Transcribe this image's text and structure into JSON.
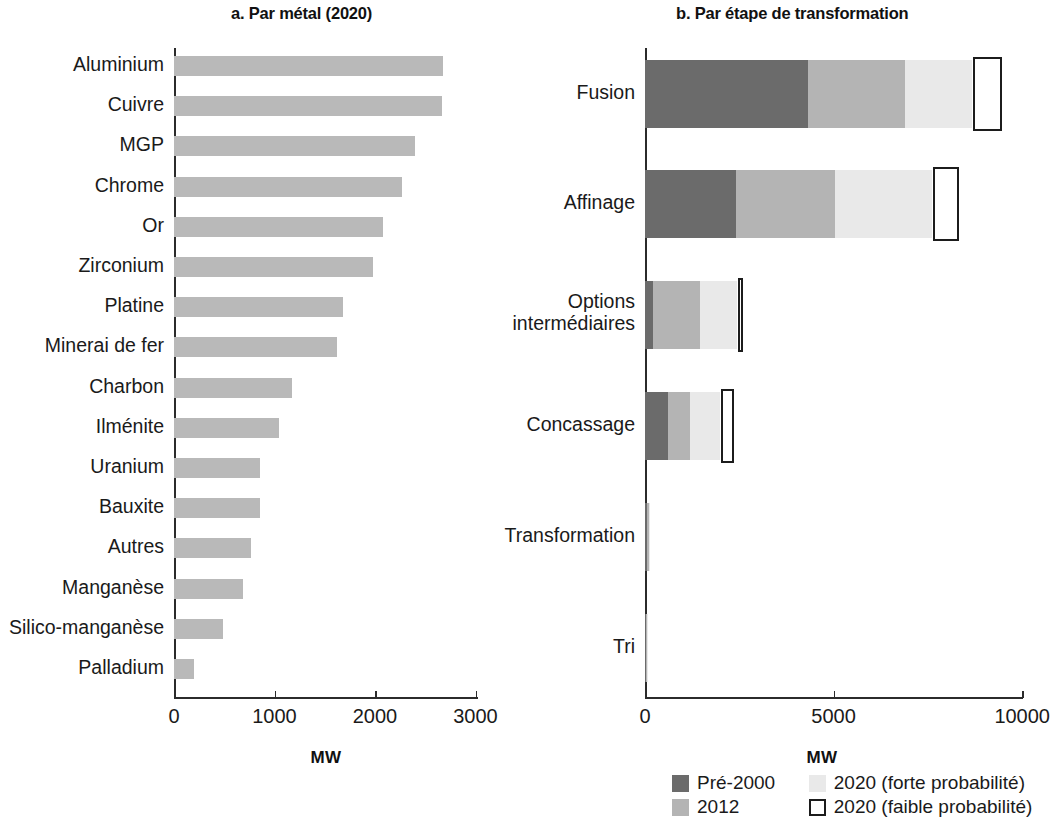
{
  "figure": {
    "panel_a_title": "a. Par métal (2020)",
    "panel_b_title": "b. Par étape de transformation"
  },
  "colors": {
    "bar_gray": "#b9b9b9",
    "pre2000": "#6b6b6b",
    "y2012": "#b4b4b4",
    "y2020_high": "#e9e9e9",
    "y2020_low_border": "#1c1c1c",
    "axis": "#2b2b2b"
  },
  "legend": {
    "items": [
      {
        "label": "Pré-2000",
        "style": "filled",
        "color": "#6b6b6b"
      },
      {
        "label": "2020 (forte probabilité)",
        "style": "filled",
        "color": "#e9e9e9"
      },
      {
        "label": "2012",
        "style": "filled",
        "color": "#b4b4b4"
      },
      {
        "label": "2020 (faible probabilité)",
        "style": "open",
        "color": "#ffffff"
      }
    ]
  },
  "chart_data": [
    {
      "type": "bar",
      "id": "panel-a",
      "title": "a. Par métal (2020)",
      "orientation": "horizontal",
      "xlabel": "MW",
      "ylabel": "",
      "xlim": [
        0,
        3000
      ],
      "xticks": [
        0,
        1000,
        2000,
        3000
      ],
      "xticklabels": [
        "0",
        "1000",
        "2000",
        "3000"
      ],
      "grid": false,
      "legend": "none",
      "categories": [
        "Aluminium",
        "Cuivre",
        "MGP",
        "Chrome",
        "Or",
        "Zirconium",
        "Platine",
        "Minerai de fer",
        "Charbon",
        "Ilménite",
        "Uranium",
        "Bauxite",
        "Autres",
        "Manganèse",
        "Silico-manganèse",
        "Palladium"
      ],
      "values": [
        2680,
        2670,
        2400,
        2270,
        2080,
        1980,
        1680,
        1620,
        1175,
        1045,
        860,
        855,
        765,
        690,
        490,
        195
      ]
    },
    {
      "type": "bar",
      "id": "panel-b",
      "title": "b. Par étape de transformation",
      "orientation": "horizontal",
      "stacked": true,
      "xlabel": "MW",
      "ylabel": "",
      "xlim": [
        0,
        10000
      ],
      "xticks": [
        0,
        5000,
        10000
      ],
      "xticklabels": [
        "0",
        "5000",
        "10000"
      ],
      "grid": false,
      "legend": "bottom",
      "categories": [
        "Fusion",
        "Options\nintermédiaires",
        "Affinage",
        "Concassage",
        "Transformation",
        "Tri"
      ],
      "categories_display": [
        "Fusion",
        "Affinage",
        "Options intermédiaires",
        "Concassage",
        "Transformation",
        "Tri"
      ],
      "series": [
        {
          "name": "Pré-2000",
          "values": [
            4320,
            2410,
            220,
            620,
            55,
            30
          ]
        },
        {
          "name": "2012",
          "values": [
            2580,
            2630,
            1230,
            580,
            40,
            25
          ]
        },
        {
          "name": "2020 (forte probabilité)",
          "values": [
            1770,
            2570,
            980,
            800,
            40,
            25
          ]
        },
        {
          "name": "2020 (faible probabilité)",
          "values": [
            770,
            690,
            140,
            320,
            0,
            0
          ]
        }
      ]
    }
  ],
  "panel_a": {
    "axis_title": "MW",
    "ticklabels": [
      "0",
      "1000",
      "2000",
      "3000"
    ],
    "rows": [
      {
        "label": "Aluminium",
        "value": 2680
      },
      {
        "label": "Cuivre",
        "value": 2670
      },
      {
        "label": "MGP",
        "value": 2400
      },
      {
        "label": "Chrome",
        "value": 2270
      },
      {
        "label": "Or",
        "value": 2080
      },
      {
        "label": "Zirconium",
        "value": 1980
      },
      {
        "label": "Platine",
        "value": 1680
      },
      {
        "label": "Minerai de fer",
        "value": 1620
      },
      {
        "label": "Charbon",
        "value": 1175
      },
      {
        "label": "Ilménite",
        "value": 1045
      },
      {
        "label": "Uranium",
        "value": 860
      },
      {
        "label": "Bauxite",
        "value": 855
      },
      {
        "label": "Autres",
        "value": 765
      },
      {
        "label": "Manganèse",
        "value": 690
      },
      {
        "label": "Silico-manganèse",
        "value": 490
      },
      {
        "label": "Palladium",
        "value": 195
      }
    ]
  },
  "panel_b": {
    "axis_title": "MW",
    "ticklabels": [
      "0",
      "5000",
      "10000"
    ],
    "rows": [
      {
        "label": "Fusion",
        "label_line1": "Fusion",
        "label_line2": "",
        "pre2000": 4320,
        "y2012": 2580,
        "y2020_high": 1770,
        "y2020_low": 770
      },
      {
        "label": "Affinage",
        "label_line1": "Affinage",
        "label_line2": "",
        "pre2000": 2410,
        "y2012": 2630,
        "y2020_high": 2570,
        "y2020_low": 690
      },
      {
        "label": "Options intermédiaires",
        "label_line1": "Options",
        "label_line2": "intermédiaires",
        "pre2000": 220,
        "y2012": 1230,
        "y2020_high": 980,
        "y2020_low": 140
      },
      {
        "label": "Concassage",
        "label_line1": "Concassage",
        "label_line2": "",
        "pre2000": 620,
        "y2012": 580,
        "y2020_high": 800,
        "y2020_low": 320
      },
      {
        "label": "Transformation",
        "label_line1": "Transformation",
        "label_line2": "",
        "pre2000": 55,
        "y2012": 40,
        "y2020_high": 40,
        "y2020_low": 0
      },
      {
        "label": "Tri",
        "label_line1": "Tri",
        "label_line2": "",
        "pre2000": 30,
        "y2012": 25,
        "y2020_high": 25,
        "y2020_low": 0
      }
    ]
  }
}
